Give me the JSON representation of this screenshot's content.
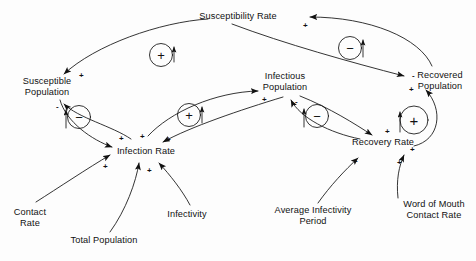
{
  "diagram": {
    "type": "causal-loop-diagram",
    "background_color": "#fdfdfd",
    "ink_color": "#111111",
    "nodes": [
      {
        "id": "susceptibility_rate",
        "label": "Susceptibility Rate",
        "x": 238,
        "y": 17,
        "lines": [
          "Susceptibility Rate"
        ]
      },
      {
        "id": "susceptible_population",
        "label": "Susceptible Population",
        "x": 47,
        "y": 89,
        "lines": [
          "Susceptible",
          "Population"
        ]
      },
      {
        "id": "infectious_population",
        "label": "Infectious Population",
        "x": 285,
        "y": 84,
        "lines": [
          "Infectious",
          "Population"
        ]
      },
      {
        "id": "recovered_population",
        "label": "Recovered Population",
        "x": 440,
        "y": 82,
        "lines": [
          "Recovered",
          "Population"
        ]
      },
      {
        "id": "infection_rate",
        "label": "Infection Rate",
        "x": 146,
        "y": 151,
        "lines": [
          "Infection Rate"
        ]
      },
      {
        "id": "recovery_rate",
        "label": "Recovery Rate",
        "x": 383,
        "y": 142,
        "lines": [
          "Recovery Rate"
        ]
      },
      {
        "id": "contact_rate",
        "label": "Contact Rate",
        "x": 30,
        "y": 215,
        "lines": [
          "Contact",
          "Rate"
        ]
      },
      {
        "id": "total_population",
        "label": "Total Population",
        "x": 104,
        "y": 241,
        "lines": [
          "Total Population"
        ]
      },
      {
        "id": "infectivity",
        "label": "Infectivity",
        "x": 187,
        "y": 215,
        "lines": [
          "Infectivity"
        ]
      },
      {
        "id": "average_infectivity_period",
        "label": "Average Infectivity Period",
        "x": 313,
        "y": 213,
        "lines": [
          "Average Infectivity",
          "Period"
        ]
      },
      {
        "id": "word_of_mouth_contact_rate",
        "label": "Word of Mouth Contact Rate",
        "x": 434,
        "y": 207,
        "lines": [
          "Word of Mouth",
          "Contact Rate"
        ]
      }
    ],
    "loop_markers": [
      {
        "id": "loop-reinforcing-top-left",
        "sign": "+",
        "type": "reinforcing",
        "cx": 161,
        "cy": 55,
        "r": 12
      },
      {
        "id": "loop-balancing-susceptible",
        "sign": "−",
        "type": "balancing",
        "cx": 79,
        "cy": 117,
        "r": 12
      },
      {
        "id": "loop-reinforcing-infection",
        "sign": "+",
        "type": "reinforcing",
        "cx": 189,
        "cy": 115,
        "r": 12
      },
      {
        "id": "loop-balancing-top-right",
        "sign": "−",
        "type": "balancing",
        "cx": 350,
        "cy": 48,
        "r": 12
      },
      {
        "id": "loop-balancing-infectious",
        "sign": "−",
        "type": "balancing",
        "cx": 317,
        "cy": 116,
        "r": 12
      },
      {
        "id": "loop-reinforcing-recovery",
        "sign": "+",
        "type": "reinforcing",
        "cx": 414,
        "cy": 120,
        "r": 14
      }
    ],
    "polarity_marks": [
      {
        "id": "pol-susceptible-in",
        "sign": "+",
        "x": 79,
        "y": 72
      },
      {
        "id": "pol-susceptible-out",
        "sign": "-",
        "x": 56,
        "y": 103
      },
      {
        "id": "pol-infection-1",
        "sign": "+",
        "x": 119,
        "y": 135
      },
      {
        "id": "pol-infection-2",
        "sign": "+",
        "x": 140,
        "y": 133
      },
      {
        "id": "pol-infection-3",
        "sign": "+",
        "x": 166,
        "y": 136
      },
      {
        "id": "pol-infection-contact",
        "sign": "+",
        "x": 103,
        "y": 163
      },
      {
        "id": "pol-infection-infectivity",
        "sign": "+",
        "x": 147,
        "y": 167
      },
      {
        "id": "pol-infectious-in",
        "sign": "+",
        "x": 262,
        "y": 96
      },
      {
        "id": "pol-infectious-out",
        "sign": "-",
        "x": 295,
        "y": 98
      },
      {
        "id": "pol-susceptibility-in",
        "sign": "+",
        "x": 303,
        "y": 22
      },
      {
        "id": "pol-recovered-in",
        "sign": "-",
        "x": 412,
        "y": 72
      },
      {
        "id": "pol-recovered-plus",
        "sign": "+",
        "x": 409,
        "y": 86
      },
      {
        "id": "pol-recovery-1",
        "sign": "+",
        "x": 385,
        "y": 128
      },
      {
        "id": "pol-recovery-2",
        "sign": "+",
        "x": 410,
        "y": 146
      },
      {
        "id": "pol-recovery-3",
        "sign": "+",
        "x": 397,
        "y": 159
      },
      {
        "id": "pol-recovery-avg",
        "sign": "-",
        "x": 355,
        "y": 157
      }
    ],
    "links": [
      {
        "from": "susceptibility_rate",
        "to": "susceptible_population",
        "polarity": "+"
      },
      {
        "from": "susceptible_population",
        "to": "infection_rate",
        "polarity": "+"
      },
      {
        "from": "infection_rate",
        "to": "susceptible_population",
        "polarity": "-"
      },
      {
        "from": "infection_rate",
        "to": "infectious_population",
        "polarity": "+"
      },
      {
        "from": "infectious_population",
        "to": "infection_rate",
        "polarity": "+"
      },
      {
        "from": "infectious_population",
        "to": "recovery_rate",
        "polarity": "+"
      },
      {
        "from": "recovery_rate",
        "to": "infectious_population",
        "polarity": "-"
      },
      {
        "from": "recovery_rate",
        "to": "recovered_population",
        "polarity": "+"
      },
      {
        "from": "recovered_population",
        "to": "susceptibility_rate",
        "polarity": "+"
      },
      {
        "from": "contact_rate",
        "to": "infection_rate",
        "polarity": "+"
      },
      {
        "from": "total_population",
        "to": "infection_rate",
        "polarity": "+"
      },
      {
        "from": "infectivity",
        "to": "infection_rate",
        "polarity": "+"
      },
      {
        "from": "average_infectivity_period",
        "to": "recovery_rate",
        "polarity": "-"
      },
      {
        "from": "word_of_mouth_contact_rate",
        "to": "recovery_rate",
        "polarity": "+"
      }
    ]
  }
}
